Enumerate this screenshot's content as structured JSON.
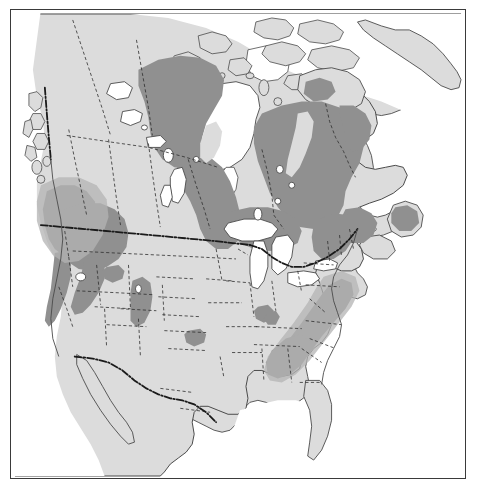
{
  "figure": {
    "type": "distribution-range-map",
    "region": "North America",
    "projection_hint": "conic",
    "frame": {
      "x": 10,
      "y": 9,
      "width": 456,
      "height": 470,
      "border_color": "#3a3a3a"
    },
    "caption": "",
    "title": ""
  },
  "colors": {
    "ocean": "#ffffff",
    "land": "#dcdcdc",
    "land_stroke": "#4a4a4a",
    "range_shade": "#909090",
    "range_shade_light": "#b4b4b4",
    "internal_border": "#2e2e2e",
    "national_border": "#1a1a1a",
    "frame": "#3a3a3a",
    "lake": "#ffffff"
  },
  "layers": [
    {
      "name": "ocean-background",
      "label": "Ocean / water",
      "fill": "#ffffff"
    },
    {
      "name": "landmass",
      "label": "Land (United States, Canada, Mexico, Greenland)",
      "fill": "#dcdcdc"
    },
    {
      "name": "species-range",
      "label": "Species distribution range (shaded)",
      "fill": "#909090"
    },
    {
      "name": "lakes",
      "label": "Great Lakes and inland lakes",
      "fill": "#ffffff"
    },
    {
      "name": "state-province-borders",
      "label": "State / province boundaries (dashed)",
      "stroke": "#2e2e2e"
    },
    {
      "name": "national-borders",
      "label": "International boundaries (bold dash-dot)",
      "stroke": "#1a1a1a"
    }
  ],
  "range_regions": [
    {
      "id": "boreal-canada",
      "label": "Boreal Canada (Manitoba, Ontario, Quebec, Labrador)"
    },
    {
      "id": "northwest-territories",
      "label": "Northwest Territories / Great Slave region"
    },
    {
      "id": "pacific-northwest",
      "label": "Pacific Northwest (coastal BC, Washington, Oregon)"
    },
    {
      "id": "northern-rockies",
      "label": "Northern Rocky Mountains (Idaho, Montana)"
    },
    {
      "id": "sierra-nevada",
      "label": "Sierra Nevada (California)"
    },
    {
      "id": "black-hills",
      "label": "Black Hills (South Dakota / Wyoming)"
    },
    {
      "id": "appalachians",
      "label": "Appalachian Mountains (Pennsylvania to Georgia)"
    },
    {
      "id": "new-england",
      "label": "New England / Maritimes"
    },
    {
      "id": "ozarks",
      "label": "Ozark Plateau (Missouri / Arkansas)"
    },
    {
      "id": "edwards-plateau",
      "label": "Central Texas outlier"
    },
    {
      "id": "baffin-island",
      "label": "Baffin Island southern tip"
    },
    {
      "id": "newfoundland",
      "label": "Newfoundland"
    }
  ],
  "labels": {
    "alt_text": "Shaded distribution map of North America showing species range across boreal Canada, the Rocky Mountains, Pacific Northwest, Appalachians and northeastern United States"
  }
}
